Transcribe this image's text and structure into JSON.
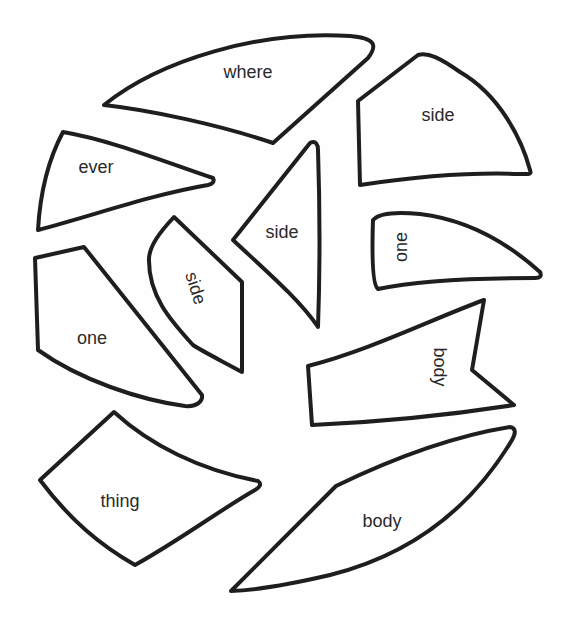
{
  "puzzle": {
    "stroke_color": "#1e1e1e",
    "text_color": "#2a2a2a",
    "pieces": [
      {
        "id": "where",
        "label": "where"
      },
      {
        "id": "side-top-right",
        "label": "side"
      },
      {
        "id": "ever",
        "label": "ever"
      },
      {
        "id": "side-center",
        "label": "side"
      },
      {
        "id": "side-rotated",
        "label": "side"
      },
      {
        "id": "one-right",
        "label": "one"
      },
      {
        "id": "one-left",
        "label": "one"
      },
      {
        "id": "body-right",
        "label": "body"
      },
      {
        "id": "thing",
        "label": "thing"
      },
      {
        "id": "body-bottom",
        "label": "body"
      }
    ]
  }
}
